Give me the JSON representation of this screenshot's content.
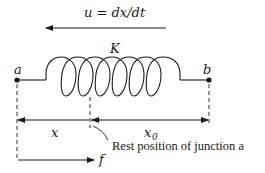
{
  "diagram": {
    "velocity_label": "u = dx/dt",
    "spring_label": "K",
    "node_a_label": "a",
    "node_b_label": "b",
    "displacement_label": "x",
    "rest_length_label": "x",
    "rest_length_subscript": "0",
    "annotation": "Rest position of junction a",
    "force_label": "f",
    "colors": {
      "stroke": "#1a1a1a",
      "background": "#ffffff"
    }
  }
}
